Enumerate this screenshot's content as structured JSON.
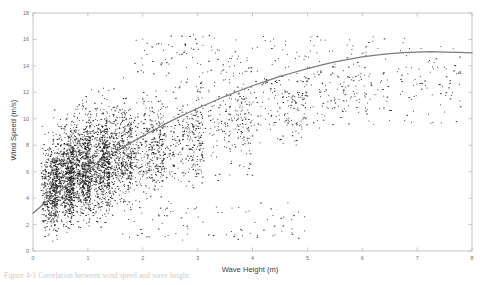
{
  "figure": {
    "caption": "Figure 4-3 Correlation between wind speed and wave height"
  },
  "chart_data": {
    "type": "scatter",
    "title": "",
    "xlabel": "Wave Height (m)",
    "ylabel": "Wind Speed (m/s)",
    "xlim": [
      0,
      8
    ],
    "ylim": [
      0,
      18
    ],
    "xticks": [
      0,
      1,
      2,
      3,
      4,
      5,
      6,
      7,
      8
    ],
    "xticklabels": [
      "0",
      "1",
      "2",
      "3",
      "4",
      "5",
      "6",
      "7",
      "8"
    ],
    "yticks": [
      0,
      2,
      4,
      6,
      8,
      10,
      12,
      14,
      16,
      18
    ],
    "yticklabels": [
      "0",
      "2",
      "4",
      "6",
      "8",
      "10",
      "12",
      "14",
      "16",
      "18"
    ],
    "grid": false,
    "legend": null,
    "marker": "dot",
    "marker_color": "#1d1d1d",
    "point_count_approx": 4200,
    "series": [
      {
        "name": "Observations",
        "type": "scatter",
        "description": "Dense cloud concentrated at wave heights 0.2-1.8 m with wind speeds 0.5-13 m/s, thinning toward higher wave heights",
        "density_bands": [
          {
            "x_range": [
              0.15,
              0.45
            ],
            "y_range": [
              0.6,
              9.8
            ],
            "n": 420
          },
          {
            "x_range": [
              0.35,
              0.75
            ],
            "y_range": [
              1.0,
              11.0
            ],
            "n": 620
          },
          {
            "x_range": [
              0.6,
              1.05
            ],
            "y_range": [
              1.2,
              12.0
            ],
            "n": 700
          },
          {
            "x_range": [
              0.9,
              1.4
            ],
            "y_range": [
              1.5,
              12.6
            ],
            "n": 640
          },
          {
            "x_range": [
              1.25,
              1.8
            ],
            "y_range": [
              2.4,
              13.2
            ],
            "n": 520
          },
          {
            "x_range": [
              1.7,
              2.4
            ],
            "y_range": [
              3.0,
              13.6
            ],
            "n": 380
          },
          {
            "x_range": [
              2.3,
              3.1
            ],
            "y_range": [
              3.6,
              14.4
            ],
            "n": 280
          },
          {
            "x_range": [
              3.0,
              4.0
            ],
            "y_range": [
              5.0,
              15.2
            ],
            "n": 200
          },
          {
            "x_range": [
              3.9,
              5.0
            ],
            "y_range": [
              6.8,
              15.6
            ],
            "n": 130
          },
          {
            "x_range": [
              4.9,
              6.2
            ],
            "y_range": [
              9.0,
              16.2
            ],
            "n": 80
          },
          {
            "x_range": [
              6.0,
              7.8
            ],
            "y_range": [
              11.0,
              16.3
            ],
            "n": 40
          }
        ],
        "sample_points": [
          [
            0.22,
            1.1
          ],
          [
            0.28,
            2.4
          ],
          [
            0.31,
            3.6
          ],
          [
            0.35,
            5.2
          ],
          [
            0.4,
            6.8
          ],
          [
            0.45,
            8.1
          ],
          [
            0.52,
            9.4
          ],
          [
            0.6,
            4.1
          ],
          [
            0.68,
            6.2
          ],
          [
            0.75,
            10.2
          ],
          [
            0.82,
            7.5
          ],
          [
            0.9,
            11.4
          ],
          [
            1.0,
            5.6
          ],
          [
            1.1,
            9.1
          ],
          [
            1.2,
            12.1
          ],
          [
            1.35,
            8.3
          ],
          [
            1.5,
            10.6
          ],
          [
            1.65,
            13.1
          ],
          [
            1.8,
            6.9
          ],
          [
            2.0,
            11.5
          ],
          [
            2.2,
            13.4
          ],
          [
            2.4,
            9.6
          ],
          [
            2.7,
            12.8
          ],
          [
            3.0,
            14.2
          ],
          [
            3.3,
            16.1
          ],
          [
            3.6,
            10.3
          ],
          [
            3.9,
            14.6
          ],
          [
            4.2,
            12.0
          ],
          [
            4.6,
            15.6
          ],
          [
            5.0,
            13.9
          ],
          [
            5.4,
            15.1
          ],
          [
            5.9,
            11.4
          ],
          [
            6.2,
            16.2
          ],
          [
            6.8,
            13.9
          ],
          [
            7.5,
            13.9
          ]
        ]
      },
      {
        "name": "Fitted trend",
        "type": "line",
        "color": "#7b7b7b",
        "description": "Monotonic saturating fit rising steeply from low wave heights then flattening near 15 m/s",
        "points": [
          [
            0.0,
            2.85
          ],
          [
            0.25,
            3.75
          ],
          [
            0.5,
            4.6
          ],
          [
            0.75,
            5.4
          ],
          [
            1.0,
            6.15
          ],
          [
            1.25,
            6.85
          ],
          [
            1.5,
            7.5
          ],
          [
            1.75,
            8.1
          ],
          [
            2.0,
            8.7
          ],
          [
            2.25,
            9.25
          ],
          [
            2.5,
            9.8
          ],
          [
            2.75,
            10.3
          ],
          [
            3.0,
            10.8
          ],
          [
            3.25,
            11.25
          ],
          [
            3.5,
            11.7
          ],
          [
            3.75,
            12.1
          ],
          [
            4.0,
            12.5
          ],
          [
            4.25,
            12.85
          ],
          [
            4.5,
            13.2
          ],
          [
            4.75,
            13.5
          ],
          [
            5.0,
            13.8
          ],
          [
            5.25,
            14.05
          ],
          [
            5.5,
            14.3
          ],
          [
            5.75,
            14.5
          ],
          [
            6.0,
            14.68
          ],
          [
            6.25,
            14.82
          ],
          [
            6.5,
            14.92
          ],
          [
            6.75,
            15.0
          ],
          [
            7.0,
            15.05
          ],
          [
            7.25,
            15.07
          ],
          [
            7.5,
            15.05
          ],
          [
            7.75,
            15.02
          ],
          [
            8.0,
            14.98
          ]
        ]
      }
    ]
  }
}
